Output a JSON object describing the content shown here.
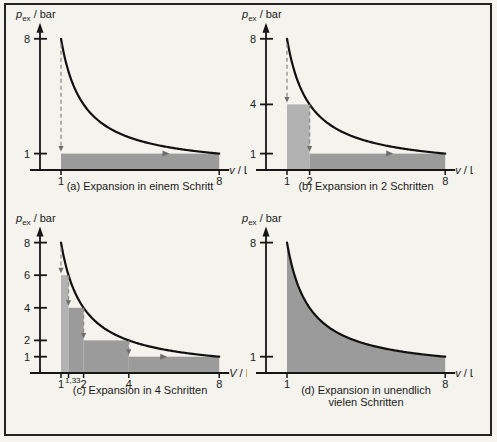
{
  "figure": {
    "background": "#f5f3ed",
    "frame_color": "#242424",
    "colors": {
      "axis": "#161616",
      "curve": "#111111",
      "step_first": "#b2b2b2",
      "step_rest": "#9b9b9b",
      "area_fill": "#9b9b9b",
      "dash_line": "#8d8d8d",
      "arrow_head": "#6e6e6e",
      "text": "#1a1a1a"
    }
  },
  "chart_data": [
    {
      "id": "a",
      "type": "area",
      "caption_lines": [
        "(a) Expansion in einem Schritt"
      ],
      "xlabel": {
        "symbol": "v",
        "unit": "/ L"
      },
      "ylabel": {
        "symbol": "p",
        "subscript": "ex",
        "unit": "/ bar"
      },
      "curve": {
        "pv_const": 8,
        "vmin": 1,
        "vmax": 8
      },
      "xlim": [
        0,
        8.6
      ],
      "ylim": [
        0,
        8.6
      ],
      "yticks": [
        {
          "p": 8,
          "label": "8"
        },
        {
          "p": 1,
          "label": "1"
        }
      ],
      "xticks": [
        {
          "v": 1,
          "label": "1"
        },
        {
          "v": 8,
          "label": "8"
        }
      ],
      "steps": [
        {
          "from": 1,
          "to": 8,
          "p": 1,
          "shade": "rest"
        }
      ],
      "drops": [
        {
          "x": 1,
          "from": 7.7,
          "to": 1
        }
      ],
      "tread_arrows": [
        {
          "x": 5.6,
          "p": 1
        }
      ],
      "fill_under_curve": false
    },
    {
      "id": "b",
      "type": "area",
      "caption_lines": [
        "(b) Expansion in 2 Schritten"
      ],
      "xlabel": {
        "symbol": "v",
        "unit": "/ L"
      },
      "ylabel": {
        "symbol": "p",
        "subscript": "ex",
        "unit": "/ bar"
      },
      "curve": {
        "pv_const": 8,
        "vmin": 1,
        "vmax": 8
      },
      "xlim": [
        0,
        8.6
      ],
      "ylim": [
        0,
        8.6
      ],
      "yticks": [
        {
          "p": 8,
          "label": "8"
        },
        {
          "p": 4,
          "label": "4"
        },
        {
          "p": 1,
          "label": "1"
        }
      ],
      "xticks": [
        {
          "v": 1,
          "label": "1"
        },
        {
          "v": 2,
          "label": "2"
        },
        {
          "v": 8,
          "label": "8"
        }
      ],
      "steps": [
        {
          "from": 1,
          "to": 2,
          "p": 4,
          "shade": "first"
        },
        {
          "from": 2,
          "to": 8,
          "p": 1,
          "shade": "rest"
        }
      ],
      "drops": [
        {
          "x": 1,
          "from": 7.7,
          "to": 4
        },
        {
          "x": 2,
          "from": 4,
          "to": 1
        }
      ],
      "tread_arrows": [
        {
          "x": 5.5,
          "p": 1
        }
      ],
      "fill_under_curve": false
    },
    {
      "id": "c",
      "type": "area",
      "caption_lines": [
        "(c) Expansion in 4 Schritten"
      ],
      "xlabel": {
        "symbol": "V",
        "unit": "/ L"
      },
      "ylabel": {
        "symbol": "p",
        "subscript": "ex",
        "unit": "/ bar"
      },
      "curve": {
        "pv_const": 8,
        "vmin": 1,
        "vmax": 8
      },
      "xlim": [
        0,
        8.6
      ],
      "ylim": [
        0,
        8.6
      ],
      "yticks": [
        {
          "p": 8,
          "label": "8"
        },
        {
          "p": 6,
          "label": "6"
        },
        {
          "p": 4,
          "label": "4"
        },
        {
          "p": 2,
          "label": "2"
        },
        {
          "p": 1,
          "label": "1"
        }
      ],
      "xticks": [
        {
          "v": 1,
          "label": "1"
        },
        {
          "v": 1.333,
          "label": "1,33",
          "sup": true
        },
        {
          "v": 2,
          "label": "2"
        },
        {
          "v": 4,
          "label": "4"
        },
        {
          "v": 8,
          "label": "8"
        }
      ],
      "steps": [
        {
          "from": 1,
          "to": 1.333,
          "p": 6,
          "shade": "first"
        },
        {
          "from": 1.333,
          "to": 2,
          "p": 4,
          "shade": "rest"
        },
        {
          "from": 2,
          "to": 4,
          "p": 2,
          "shade": "rest"
        },
        {
          "from": 4,
          "to": 8,
          "p": 1,
          "shade": "rest"
        }
      ],
      "drops": [
        {
          "x": 1,
          "from": 7.7,
          "to": 6
        },
        {
          "x": 1.333,
          "from": 6,
          "to": 4
        },
        {
          "x": 2,
          "from": 4,
          "to": 2
        },
        {
          "x": 4,
          "from": 2,
          "to": 1
        }
      ],
      "tread_arrows": [
        {
          "x": 5.5,
          "p": 1
        }
      ],
      "fill_under_curve": false
    },
    {
      "id": "d",
      "type": "area",
      "caption_lines": [
        "(d) Expansion in unendlich",
        "vielen Schritten"
      ],
      "xlabel": {
        "symbol": "v",
        "unit": "/ L"
      },
      "ylabel": {
        "symbol": "p",
        "subscript": "ex",
        "unit": "/ bar"
      },
      "curve": {
        "pv_const": 8,
        "vmin": 1,
        "vmax": 8
      },
      "xlim": [
        0,
        8.6
      ],
      "ylim": [
        0,
        8.6
      ],
      "yticks": [
        {
          "p": 8,
          "label": "8"
        },
        {
          "p": 1,
          "label": "1"
        }
      ],
      "xticks": [
        {
          "v": 1,
          "label": "1"
        },
        {
          "v": 8,
          "label": "8"
        }
      ],
      "steps": [],
      "drops": [],
      "tread_arrows": [],
      "fill_under_curve": true
    }
  ]
}
